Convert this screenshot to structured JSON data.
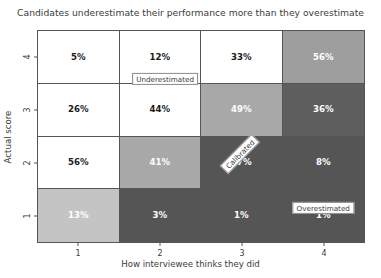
{
  "chart_data": {
    "type": "heatmap",
    "title": "Candidates underestimate their performance more than they overestimate",
    "xlabel": "How interviewee thinks they did",
    "ylabel": "Actual score",
    "x_categories": [
      "1",
      "2",
      "3",
      "4"
    ],
    "y_categories": [
      "4",
      "3",
      "2",
      "1"
    ],
    "value_suffix": "%",
    "grid": true,
    "legend": "none",
    "colormap": "greys_reversed",
    "rows": [
      {
        "y": "4",
        "cells": [
          {
            "x": "1",
            "value": 5,
            "label": "5%",
            "bg": "#ffffff",
            "fg": "#1a1a1a"
          },
          {
            "x": "2",
            "value": 12,
            "label": "12%",
            "bg": "#ffffff",
            "fg": "#1a1a1a"
          },
          {
            "x": "3",
            "value": 33,
            "label": "33%",
            "bg": "#ffffff",
            "fg": "#1a1a1a"
          },
          {
            "x": "4",
            "value": 56,
            "label": "56%",
            "bg": "#9e9e9e",
            "fg": "#ffffff"
          }
        ]
      },
      {
        "y": "3",
        "cells": [
          {
            "x": "1",
            "value": 26,
            "label": "26%",
            "bg": "#ffffff",
            "fg": "#1a1a1a"
          },
          {
            "x": "2",
            "value": 44,
            "label": "44%",
            "bg": "#ffffff",
            "fg": "#1a1a1a"
          },
          {
            "x": "3",
            "value": 49,
            "label": "49%",
            "bg": "#a8a8a8",
            "fg": "#ffffff"
          },
          {
            "x": "4",
            "value": 36,
            "label": "36%",
            "bg": "#5e5e5e",
            "fg": "#ffffff"
          }
        ]
      },
      {
        "y": "2",
        "cells": [
          {
            "x": "1",
            "value": 56,
            "label": "56%",
            "bg": "#ffffff",
            "fg": "#1a1a1a"
          },
          {
            "x": "2",
            "value": 41,
            "label": "41%",
            "bg": "#a8a8a8",
            "fg": "#ffffff"
          },
          {
            "x": "3",
            "value": 17,
            "label": "17%",
            "bg": "#555555",
            "fg": "#ffffff"
          },
          {
            "x": "4",
            "value": 8,
            "label": "8%",
            "bg": "#555555",
            "fg": "#ffffff"
          }
        ]
      },
      {
        "y": "1",
        "cells": [
          {
            "x": "1",
            "value": 13,
            "label": "13%",
            "bg": "#c4c4c4",
            "fg": "#ffffff"
          },
          {
            "x": "2",
            "value": 3,
            "label": "3%",
            "bg": "#555555",
            "fg": "#ffffff"
          },
          {
            "x": "3",
            "value": 1,
            "label": "1%",
            "bg": "#555555",
            "fg": "#ffffff"
          },
          {
            "x": "4",
            "value": 1,
            "label": "1%",
            "bg": "#555555",
            "fg": "#ffffff"
          }
        ]
      }
    ],
    "annotations": [
      {
        "text": "Underestimated",
        "x_pct": 39.0,
        "y_pct": 22.8,
        "rotation": 0
      },
      {
        "text": "Calibrated",
        "x_pct": 62.0,
        "y_pct": 58.5,
        "rotation": -45
      },
      {
        "text": "Overestimated",
        "x_pct": 87.5,
        "y_pct": 84.0,
        "rotation": 0
      }
    ]
  },
  "axes": {
    "x_ticks": [
      "1",
      "2",
      "3",
      "4"
    ],
    "y_ticks": [
      "4",
      "3",
      "2",
      "1"
    ]
  }
}
